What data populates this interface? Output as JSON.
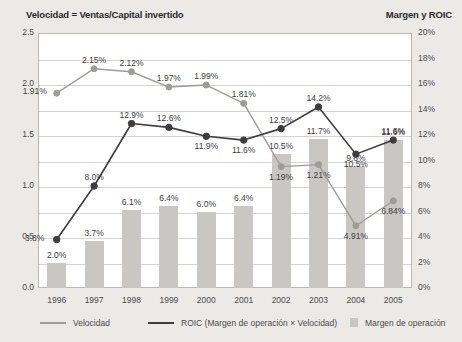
{
  "titles": {
    "left": "Velocidad = Ventas/Capital invertido",
    "right": "Margen y ROIC"
  },
  "axes": {
    "left_ticks": [
      "2.5",
      "2.0",
      "1.5",
      "1.0",
      "0.5",
      "0.0"
    ],
    "right_ticks": [
      "20%",
      "18%",
      "16%",
      "14%",
      "12%",
      "10%",
      "8%",
      "6%",
      "4%",
      "2%",
      "0%"
    ],
    "left_min": 0.0,
    "left_max": 2.5,
    "right_min": 0,
    "right_max": 20
  },
  "legend": {
    "velocidad": "Velocidad",
    "roic": "ROIC (Margen de operación × Velocidad)",
    "margen": "Margen de operación"
  },
  "colors": {
    "bar": "#c9c7c4",
    "velocidad_line": "#9e9c99",
    "roic_line": "#3d3d3d",
    "plot_bg": "#ffffff",
    "page_bg": "#eceae7",
    "grid": "#d6d4d1"
  },
  "chart_data": {
    "type": "line",
    "xlabel": "",
    "ylabel": "Velocidad = Ventas/Capital invertido",
    "y2label": "Margen y ROIC",
    "ylim": [
      0.0,
      2.5
    ],
    "y2lim": [
      0,
      20
    ],
    "grid": true,
    "legend_position": "bottom",
    "categories": [
      "1996",
      "1997",
      "1998",
      "1999",
      "2000",
      "2001",
      "2002",
      "2003",
      "2004",
      "2005"
    ],
    "series": [
      {
        "name": "Margen de operación",
        "type": "bar",
        "axis": "right",
        "values": [
          2.0,
          3.7,
          6.1,
          6.4,
          6.0,
          6.4,
          10.5,
          11.7,
          9.6,
          11.6
        ],
        "labels": [
          "2.0%",
          "3.7%",
          "6.1%",
          "6.4%",
          "6.0%",
          "6.4%",
          "10.5%",
          "11.7%",
          "9.6%",
          "11.6%"
        ]
      },
      {
        "name": "ROIC (Margen de operación × Velocidad)",
        "type": "line",
        "axis": "right",
        "values": [
          3.8,
          8.0,
          12.9,
          12.6,
          11.9,
          11.6,
          12.5,
          14.2,
          10.5,
          11.6
        ],
        "labels": [
          "3.8%",
          "8.0%",
          "12.9%",
          "12.6%",
          "11.9%",
          "11.6%",
          "12.5%",
          "14.2%",
          "10.5%",
          "11.6%"
        ]
      },
      {
        "name": "Velocidad",
        "type": "line",
        "axis": "left",
        "values": [
          1.91,
          2.15,
          2.12,
          1.97,
          1.99,
          1.81,
          1.19,
          1.21,
          0.61,
          0.855
        ],
        "labels": [
          "1.91%",
          "2.15%",
          "2.12%",
          "1.97%",
          "1.99%",
          "1.81%",
          "1.19%",
          "1.21%",
          "4.91%",
          "6.84%"
        ]
      }
    ]
  },
  "label_offsets": {
    "bar": [
      "above",
      "above",
      "above",
      "above",
      "above",
      "above",
      "above",
      "above",
      "above",
      "above"
    ],
    "roic": [
      "left",
      "above",
      "above",
      "above",
      "below",
      "below",
      "above",
      "above",
      "below",
      "above"
    ],
    "velocidad": [
      "left",
      "above",
      "above",
      "above",
      "above",
      "above",
      "below",
      "below",
      "below",
      "below"
    ]
  }
}
